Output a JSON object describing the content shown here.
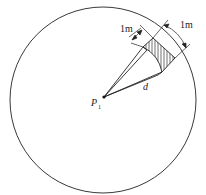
{
  "diagram": {
    "type": "geometry",
    "labels": {
      "point": "P",
      "point_sub": "1",
      "distance": "d",
      "width_label": "1m",
      "arc_label": "1m"
    },
    "colors": {
      "stroke": "#222222",
      "background": "#ffffff"
    }
  }
}
